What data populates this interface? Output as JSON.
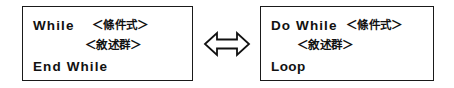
{
  "diagram": {
    "arrow": {
      "icon": "double-headed-horizontal-arrow",
      "symbol": "⟺",
      "meaning": "equivalent-to",
      "stroke_color": "#111111",
      "fill_color": "#ffffff"
    },
    "box_border_color": "#1a1a1a",
    "text_color": "#111111",
    "background_color": "#ffffff",
    "boxes": [
      {
        "id": "while-box",
        "name": "While loop pseudocode block",
        "lines": [
          {
            "keyword": "While",
            "placeholder": "＜條件式＞"
          },
          {
            "keyword": "",
            "placeholder": "＜敘述群＞"
          },
          {
            "keyword": "End  While",
            "placeholder": ""
          }
        ]
      },
      {
        "id": "dowhile-box",
        "name": "Do While loop pseudocode block",
        "lines": [
          {
            "keyword": "Do While",
            "placeholder": "＜條件式＞"
          },
          {
            "keyword": "",
            "placeholder": "＜敘述群＞"
          },
          {
            "keyword": "Loop",
            "placeholder": ""
          }
        ]
      }
    ]
  }
}
